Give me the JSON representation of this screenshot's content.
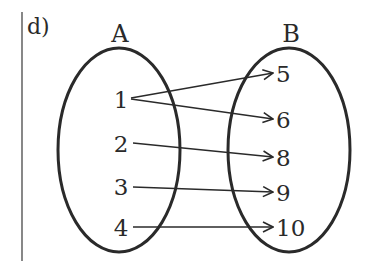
{
  "part_label": "d)",
  "sets": {
    "A": {
      "label": "A",
      "elements": [
        {
          "value": "1",
          "y": 100
        },
        {
          "value": "2",
          "y": 144
        },
        {
          "value": "3",
          "y": 187
        },
        {
          "value": "4",
          "y": 228
        }
      ]
    },
    "B": {
      "label": "B",
      "elements": [
        {
          "value": "5",
          "y": 74
        },
        {
          "value": "6",
          "y": 120
        },
        {
          "value": "8",
          "y": 158
        },
        {
          "value": "9",
          "y": 193
        },
        {
          "value": "10",
          "y": 228
        }
      ]
    }
  },
  "mappings": [
    {
      "from": "1",
      "to": "5"
    },
    {
      "from": "1",
      "to": "6"
    },
    {
      "from": "2",
      "to": "8"
    },
    {
      "from": "3",
      "to": "9"
    },
    {
      "from": "4",
      "to": "10"
    }
  ],
  "colors": {
    "stroke": "#2a2a2a",
    "background": "#ffffff"
  }
}
